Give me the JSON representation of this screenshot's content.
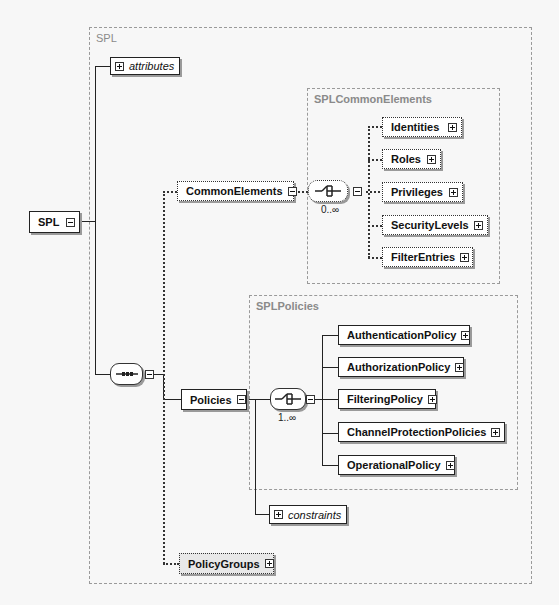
{
  "diagram": {
    "root": {
      "label": "SPL"
    },
    "outer_frame": {
      "title": "SPL"
    },
    "attributes": {
      "label": "attributes"
    },
    "common_elements": {
      "label": "CommonElements",
      "frame_title": "SPLCommonElements",
      "compositor": {
        "type": "choice",
        "occurrence": "0..∞"
      },
      "children": [
        {
          "label": "Identities"
        },
        {
          "label": "Roles"
        },
        {
          "label": "Privileges"
        },
        {
          "label": "SecurityLevels"
        },
        {
          "label": "FilterEntries"
        }
      ]
    },
    "sequence": {
      "type": "sequence"
    },
    "policies": {
      "label": "Policies",
      "frame_title": "SPLPolicies",
      "compositor": {
        "type": "choice",
        "occurrence": "1..∞"
      },
      "children": [
        {
          "label": "AuthenticationPolicy"
        },
        {
          "label": "AuthorizationPolicy"
        },
        {
          "label": "FilteringPolicy"
        },
        {
          "label": "ChannelProtectionPolicies"
        },
        {
          "label": "OperationalPolicy"
        }
      ],
      "constraints": {
        "label": "constraints"
      }
    },
    "policy_groups": {
      "label": "PolicyGroups"
    }
  }
}
